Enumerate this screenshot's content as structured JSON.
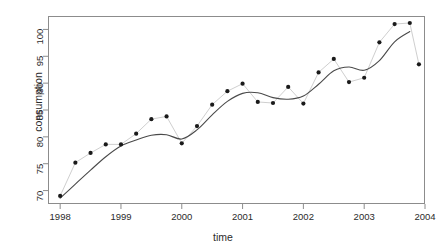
{
  "chart_data": {
    "type": "scatter",
    "title": "",
    "xlabel": "time",
    "ylabel": "consumption",
    "xlim": [
      1997.8,
      2004.0
    ],
    "ylim": [
      67.5,
      102.5
    ],
    "xticks": [
      1998,
      1999,
      2000,
      2001,
      2002,
      2003,
      2004
    ],
    "xtick_labels": [
      "1998",
      "1999",
      "2000",
      "2001",
      "2002",
      "2003",
      "2004"
    ],
    "yticks": [
      70,
      75,
      80,
      85,
      90,
      95,
      100
    ],
    "ytick_labels": [
      "70",
      "75",
      "80",
      "85",
      "90",
      "95",
      "100"
    ],
    "grid": false,
    "legend": null,
    "series": [
      {
        "name": "consumption",
        "marker": "filled-circle",
        "marker_color": "#1a1a1a",
        "connector_color": "#cfcfcf",
        "x": [
          1998.0,
          1998.25,
          1998.5,
          1998.75,
          1999.0,
          1999.25,
          1999.5,
          1999.75,
          2000.0,
          2000.25,
          2000.5,
          2000.75,
          2001.0,
          2001.25,
          2001.5,
          2001.75,
          2002.0,
          2002.25,
          2002.5,
          2002.75,
          2003.0,
          2003.25,
          2003.5,
          2003.75
        ],
        "y": [
          69.0,
          75.2,
          77.0,
          78.6,
          78.6,
          80.6,
          83.3,
          83.8,
          78.8,
          82.0,
          86.0,
          88.5,
          89.9,
          86.5,
          86.3,
          89.3,
          86.2,
          92.0,
          94.5,
          90.2,
          91.0,
          97.6,
          101.0,
          101.2
        ],
        "extra_points_x": [
          2003.9
        ],
        "extra_points_y": [
          93.5
        ]
      },
      {
        "name": "smooth-trend",
        "type": "line",
        "line_color": "#4a4a4a",
        "x": [
          1998.0,
          1998.25,
          1998.5,
          1998.75,
          1999.0,
          1999.25,
          1999.5,
          1999.75,
          2000.0,
          2000.25,
          2000.5,
          2000.75,
          2001.0,
          2001.25,
          2001.5,
          2001.75,
          2002.0,
          2002.25,
          2002.5,
          2002.75,
          2003.0,
          2003.25,
          2003.5,
          2003.75
        ],
        "y": [
          68.6,
          71.2,
          73.8,
          76.3,
          78.3,
          79.4,
          80.3,
          80.4,
          79.6,
          81.3,
          84.1,
          86.6,
          88.1,
          88.2,
          87.3,
          87.0,
          87.6,
          89.8,
          92.3,
          93.0,
          92.4,
          94.2,
          97.7,
          99.6
        ]
      }
    ]
  },
  "axes": {
    "y_title": "consumption",
    "x_title": "time"
  }
}
